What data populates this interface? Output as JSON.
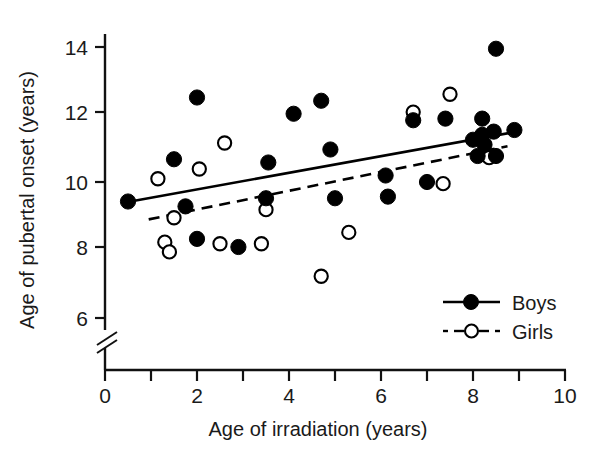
{
  "chart_data": {
    "type": "scatter",
    "title": "",
    "xlabel": "Age of irradiation (years)",
    "ylabel": "Age of pubertal onset (years)",
    "xlim": [
      0,
      10
    ],
    "ylim": [
      5.4,
      14.8
    ],
    "y_axis_break": true,
    "y_axis_break_note": "axis broken below 6",
    "grid": false,
    "legend_position": "bottom-right",
    "x_ticks": [
      0,
      1,
      2,
      3,
      4,
      5,
      6,
      7,
      8,
      9,
      10
    ],
    "x_tick_labels": [
      "0",
      "",
      "2",
      "",
      "4",
      "",
      "6",
      "",
      "8",
      "",
      "10"
    ],
    "y_ticks": [
      6,
      8,
      10,
      12,
      14
    ],
    "y_tick_labels": [
      "6",
      "8",
      "10",
      "12",
      "14"
    ],
    "series": [
      {
        "name": "Boys",
        "marker": "filled-circle",
        "color": "#000000",
        "line_style": "solid",
        "points": [
          [
            0.5,
            9.4
          ],
          [
            1.5,
            10.7
          ],
          [
            1.75,
            9.25
          ],
          [
            2.0,
            12.6
          ],
          [
            2.0,
            8.25
          ],
          [
            2.9,
            8.0
          ],
          [
            3.5,
            9.5
          ],
          [
            3.55,
            10.6
          ],
          [
            4.1,
            12.1
          ],
          [
            4.7,
            12.5
          ],
          [
            4.9,
            11.0
          ],
          [
            5.0,
            9.5
          ],
          [
            6.1,
            10.2
          ],
          [
            6.15,
            9.55
          ],
          [
            6.7,
            11.9
          ],
          [
            7.0,
            10.0
          ],
          [
            7.4,
            11.95
          ],
          [
            8.0,
            11.3
          ],
          [
            8.1,
            10.8
          ],
          [
            8.2,
            11.95
          ],
          [
            8.2,
            11.45
          ],
          [
            8.25,
            11.15
          ],
          [
            8.45,
            11.55
          ],
          [
            8.5,
            14.1
          ],
          [
            8.5,
            10.8
          ],
          [
            8.9,
            11.6
          ]
        ],
        "fit_line": {
          "x_start": 0.55,
          "x_end": 8.95,
          "y_start": 9.4,
          "y_end": 11.55
        }
      },
      {
        "name": "Girls",
        "marker": "open-circle",
        "color": "#ffffff",
        "line_style": "dashed",
        "points": [
          [
            1.15,
            10.1
          ],
          [
            1.3,
            8.15
          ],
          [
            1.4,
            7.85
          ],
          [
            1.5,
            8.9
          ],
          [
            2.05,
            10.4
          ],
          [
            2.5,
            8.1
          ],
          [
            2.6,
            11.2
          ],
          [
            3.4,
            8.1
          ],
          [
            3.5,
            9.15
          ],
          [
            4.7,
            7.1
          ],
          [
            5.3,
            8.45
          ],
          [
            6.7,
            12.15
          ],
          [
            7.35,
            9.95
          ],
          [
            7.5,
            12.7
          ],
          [
            8.35,
            10.75
          ]
        ],
        "fit_line": {
          "x_start": 0.95,
          "x_end": 8.75,
          "y_start": 8.85,
          "y_end": 11.1
        }
      }
    ]
  },
  "legend": {
    "entries": [
      {
        "label": "Boys",
        "marker": "filled-circle",
        "line_style": "solid"
      },
      {
        "label": "Girls",
        "marker": "open-circle",
        "line_style": "dashed"
      }
    ]
  },
  "colors": {
    "ink": "#111111",
    "marker_fill_boys": "#000000",
    "marker_fill_girls": "#ffffff",
    "background": "#ffffff"
  }
}
